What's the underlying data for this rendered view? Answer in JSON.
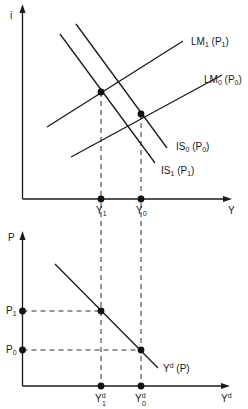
{
  "top_panel": {
    "y_axis_label": "i",
    "x_axis_label": "Y",
    "curves": {
      "LM1": {
        "name": "LM",
        "sub": "1",
        "arg": "P",
        "arg_sub": "1"
      },
      "LM0": {
        "name": "LM",
        "sub": "0",
        "arg": "P",
        "arg_sub": "0"
      },
      "IS0": {
        "name": "IS",
        "sub": "0",
        "arg": "P",
        "arg_sub": "0"
      },
      "IS1": {
        "name": "IS",
        "sub": "1",
        "arg": "P",
        "arg_sub": "1"
      }
    },
    "x_ticks": {
      "Y1": {
        "name": "Y",
        "sub": "1"
      },
      "Y0": {
        "name": "Y",
        "sub": "0"
      }
    }
  },
  "bottom_panel": {
    "y_axis_label": "P",
    "x_axis_label": "Y",
    "x_axis_sup": "d",
    "curve": {
      "name": "Y",
      "sup": "d",
      "arg": "(P)"
    },
    "y_ticks": {
      "P1": {
        "name": "P",
        "sub": "1"
      },
      "P0": {
        "name": "P",
        "sub": "0"
      }
    },
    "x_ticks": {
      "Yd1": {
        "name": "Y",
        "sup": "d",
        "sub": "1"
      },
      "Yd0": {
        "name": "Y",
        "sup": "d",
        "sub": "0"
      }
    }
  }
}
